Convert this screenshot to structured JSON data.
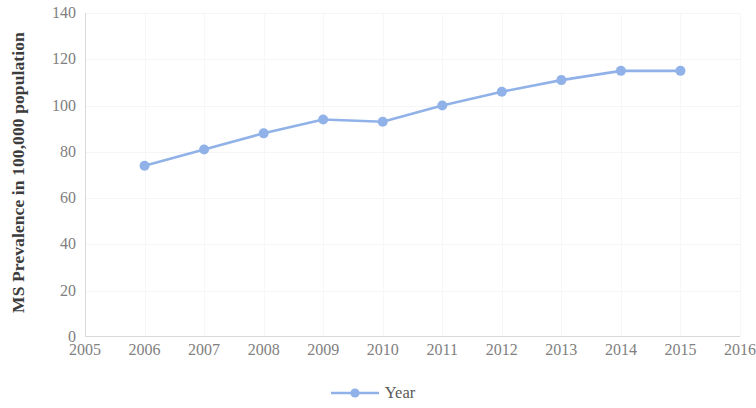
{
  "chart_data": {
    "type": "line",
    "title": "",
    "subtitle": "",
    "xlabel": "",
    "ylabel": "MS Prevalence in 100,000 population",
    "x": [
      2006,
      2007,
      2008,
      2009,
      2010,
      2011,
      2012,
      2013,
      2014,
      2015
    ],
    "values": [
      74,
      81,
      88,
      94,
      93,
      100,
      106,
      111,
      115,
      115
    ],
    "series": [
      {
        "name": "Year",
        "x": [
          2006,
          2007,
          2008,
          2009,
          2010,
          2011,
          2012,
          2013,
          2014,
          2015
        ],
        "values": [
          74,
          81,
          88,
          94,
          93,
          100,
          106,
          111,
          115,
          115
        ],
        "color": "#91b2e8",
        "marker": "circle"
      }
    ],
    "xlim": [
      2005,
      2016
    ],
    "ylim": [
      0,
      140
    ],
    "x_ticks": [
      2005,
      2006,
      2007,
      2008,
      2009,
      2010,
      2011,
      2012,
      2013,
      2014,
      2015,
      2016
    ],
    "x_tick_labels": [
      "2005",
      "2006",
      "2007",
      "2008",
      "2009",
      "2010",
      "2011",
      "2012",
      "2013",
      "2014",
      "2015",
      "2016"
    ],
    "y_ticks": [
      0,
      20,
      40,
      60,
      80,
      100,
      120,
      140
    ],
    "y_tick_labels": [
      "0",
      "20",
      "40",
      "60",
      "80",
      "100",
      "120",
      "140"
    ],
    "grid": true,
    "grid_color": "#f4f5f7",
    "legend": {
      "position": "bottom",
      "entries": [
        {
          "label": "Year",
          "color": "#91b2e8",
          "marker": "circle"
        }
      ]
    },
    "axis_color": "#d9d9d9",
    "tick_label_color": "#808080",
    "axis_title_color": "#3c3c3c",
    "background": "#ffffff"
  },
  "legend": {
    "label": "Year",
    "marker_icon": "line-marker-icon"
  },
  "axes": {
    "y_title": "MS Prevalence in 100,000 population"
  }
}
